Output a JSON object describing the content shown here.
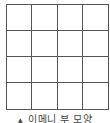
{
  "diagram": {
    "type": "grid",
    "rows": 4,
    "columns": 4,
    "line_color": "#555555",
    "background_color": "#ffffff"
  },
  "caption": {
    "marker_icon": "triangle-up-icon",
    "marker_glyph": "▲",
    "text": "이메니 부 모양"
  }
}
